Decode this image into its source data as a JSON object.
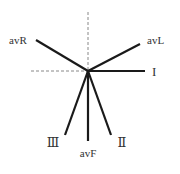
{
  "diagram": {
    "type": "hexaxial-lead-reference",
    "center": [
      88,
      71
    ],
    "axes_dashed": {
      "vertical": {
        "x": 88,
        "y1": 12,
        "y2": 71
      },
      "horizontal": {
        "y": 71,
        "x1": 31,
        "x2": 88
      }
    },
    "leads": [
      {
        "id": "avR",
        "label": "avR",
        "end": [
          36,
          40
        ],
        "label_pos": [
          9,
          44
        ],
        "anchor": "start"
      },
      {
        "id": "avL",
        "label": "avL",
        "end": [
          140,
          44
        ],
        "label_pos": [
          147,
          44
        ],
        "anchor": "start"
      },
      {
        "id": "I",
        "label": "I",
        "end": [
          145,
          71
        ],
        "label_pos": [
          152,
          76
        ],
        "anchor": "start"
      },
      {
        "id": "III",
        "label": "Ⅲ",
        "end": [
          65,
          135
        ],
        "label_pos": [
          53,
          147
        ],
        "anchor": "middle"
      },
      {
        "id": "avF",
        "label": "avF",
        "end": [
          88,
          141
        ],
        "label_pos": [
          88,
          157
        ],
        "anchor": "middle"
      },
      {
        "id": "II",
        "label": "Ⅱ",
        "end": [
          111,
          135
        ],
        "label_pos": [
          122,
          147
        ],
        "anchor": "middle"
      }
    ],
    "colors": {
      "line": "#1a1a1a",
      "dashed": "#888888",
      "text": "#333333"
    }
  }
}
